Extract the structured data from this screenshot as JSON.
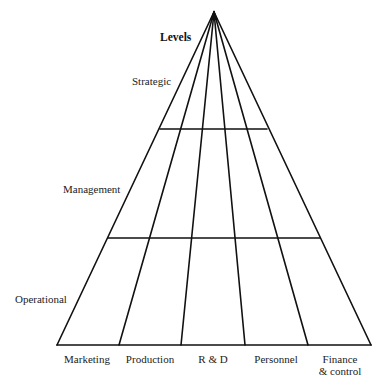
{
  "diagram": {
    "title": "Levels",
    "levels": [
      {
        "label": "Strategic"
      },
      {
        "label": "Management"
      },
      {
        "label": "Operational"
      }
    ],
    "functions": [
      {
        "label": "Marketing"
      },
      {
        "label": "Production"
      },
      {
        "label": "R & D"
      },
      {
        "label": "Personnel"
      },
      {
        "label": "Finance\n& control",
        "line1": "Finance",
        "line2": "& control"
      }
    ],
    "colors": {
      "line": "#111111",
      "background": "#ffffff",
      "text": "#222222"
    }
  }
}
